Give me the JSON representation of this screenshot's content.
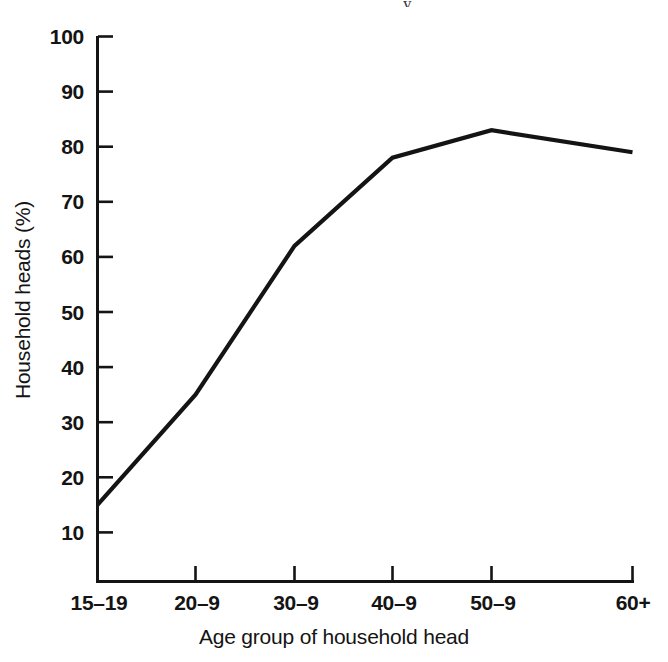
{
  "figure": {
    "background_color": "#ffffff",
    "line_color": "#141414",
    "axis_color": "#141414",
    "top_artifact_glyph": "y"
  },
  "chart_data": {
    "type": "line",
    "title": "",
    "subtitle": "",
    "xlabel": "Age group of household head",
    "ylabel": "Household heads (%)",
    "categories": [
      "15–19",
      "20–9",
      "30–9",
      "40–9",
      "50–9",
      "60+"
    ],
    "values": [
      15,
      35,
      62,
      78,
      83,
      79
    ],
    "series": [
      {
        "name": "Household heads",
        "values": [
          15,
          35,
          62,
          78,
          83,
          79
        ]
      }
    ],
    "ylim": [
      0,
      100
    ],
    "ytick_labels": [
      "100",
      "90",
      "80",
      "70",
      "60",
      "50",
      "40",
      "30",
      "20",
      "10"
    ],
    "ytick_values": [
      100,
      90,
      80,
      70,
      60,
      50,
      40,
      30,
      20,
      10
    ],
    "xtick_labels": [
      "15–19",
      "20–9",
      "30–9",
      "40–9",
      "50–9",
      "60+"
    ],
    "grid": false,
    "legend": false,
    "legend_position": "none",
    "annotations": []
  },
  "yticks": {
    "t100": "100",
    "t90": "90",
    "t80": "80",
    "t70": "70",
    "t60": "60",
    "t50": "50",
    "t40": "40",
    "t30": "30",
    "t20": "20",
    "t10": "10"
  },
  "xticks": {
    "t1": "15–19",
    "t2": "20–9",
    "t3": "30–9",
    "t4": "40–9",
    "t5": "50–9",
    "t6": "60+"
  },
  "labels": {
    "x_axis_title": "Age group of household head",
    "y_axis_title": "Household heads (%)"
  }
}
